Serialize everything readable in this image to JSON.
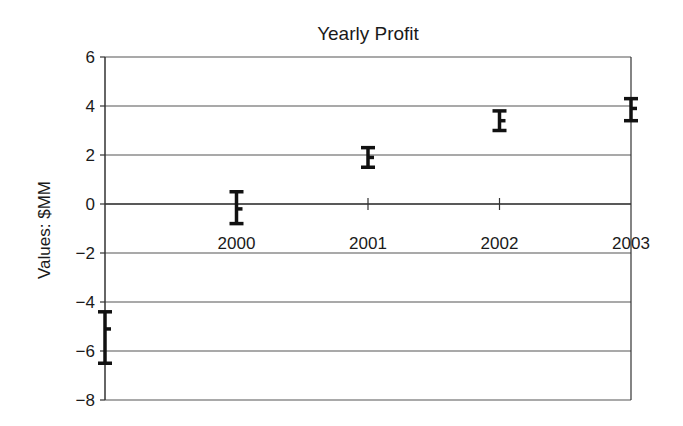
{
  "chart_data": {
    "type": "scatter",
    "title": "Yearly Profit",
    "xlabel": "",
    "ylabel": "Values: $MM",
    "ylim": [
      -8,
      6
    ],
    "yticks": [
      6,
      4,
      2,
      0,
      -2,
      -4,
      -6,
      -8
    ],
    "ytick_labels": [
      "6",
      "4",
      "2",
      "0",
      "−2",
      "−4",
      "−6",
      "−8"
    ],
    "categories": [
      "1999",
      "2000",
      "2001",
      "2002",
      "2003"
    ],
    "xtick_labels": [
      "",
      "2000",
      "2001",
      "2002",
      "2003"
    ],
    "grid": true,
    "legend": null,
    "series": [
      {
        "name": "Yearly Profit",
        "values": [
          -5.1,
          -0.2,
          1.9,
          3.4,
          3.9
        ],
        "error_high": [
          -4.4,
          0.5,
          2.3,
          3.8,
          4.3
        ],
        "error_low": [
          -6.5,
          -0.8,
          1.5,
          3.0,
          3.4
        ]
      }
    ]
  },
  "colors": {
    "background": "#ffffff",
    "axis": "#333333",
    "grid": "#555555",
    "marker": "#111111"
  }
}
